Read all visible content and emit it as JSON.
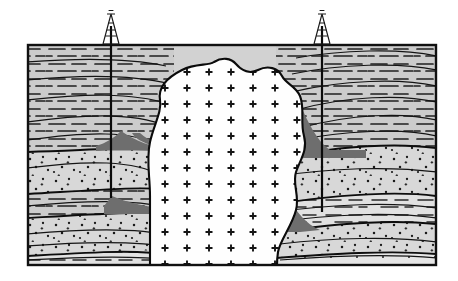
{
  "figure": {
    "domain": "geological-cross-section",
    "title": "",
    "caption": "",
    "background_color": "#ffffff",
    "frame": {
      "x": 27,
      "y": 44,
      "width": 410,
      "height": 222,
      "stroke": "#111111",
      "stroke_width": 2
    }
  },
  "palette": {
    "shale_fill": "#cccccc",
    "sandstone_fill": "#d7d7d7",
    "pale_band_fill": "#e3e3e3",
    "hydrocarbon_trap_fill": "#6e6e6e",
    "intrusion_fill": "#fefefe",
    "line_color": "#111111",
    "pattern_color": "#1a1a1a"
  },
  "legend_symbols": [
    {
      "name": "shale",
      "symbol": "dashed-horizontal-lines",
      "fill": "#cccccc"
    },
    {
      "name": "sandstone",
      "symbol": "stipple-dots",
      "fill": "#d7d7d7"
    },
    {
      "name": "salt-dome-intrusion",
      "symbol": "plus-crosses",
      "fill": "#fefefe"
    },
    {
      "name": "hydrocarbon-trap",
      "symbol": "solid-dark-gray",
      "fill": "#6e6e6e"
    }
  ],
  "intrusion": {
    "label": "salt dome",
    "symbol": "plus-crosses",
    "cross_rows": 14,
    "cross_spacing_x": 22,
    "cross_spacing_y": 16,
    "cross_size": 7
  },
  "strata_left": [
    {
      "name": "upper-shale",
      "rock": "shale",
      "pattern": "dashed"
    },
    {
      "name": "upper-sandstone",
      "rock": "sandstone",
      "pattern": "dots"
    },
    {
      "name": "middle-shale",
      "rock": "shale",
      "pattern": "dashed"
    },
    {
      "name": "lower-sandstone",
      "rock": "sandstone",
      "pattern": "dots"
    },
    {
      "name": "basal-band",
      "rock": "shale",
      "pattern": "dashed"
    }
  ],
  "strata_right": [
    {
      "name": "upper-shale",
      "rock": "shale",
      "pattern": "dashed"
    },
    {
      "name": "upper-sandstone",
      "rock": "sandstone",
      "pattern": "dots"
    },
    {
      "name": "middle-shale",
      "rock": "shale",
      "pattern": "dashed"
    },
    {
      "name": "lower-sandstone",
      "rock": "sandstone",
      "pattern": "dots"
    },
    {
      "name": "basal-band",
      "rock": "shale",
      "pattern": "dashed"
    }
  ],
  "traps": [
    {
      "name": "left-upper-trap",
      "side": "left",
      "fill": "#6e6e6e"
    },
    {
      "name": "left-lower-trap",
      "side": "left",
      "fill": "#6e6e6e"
    },
    {
      "name": "right-upper-trap",
      "side": "right",
      "fill": "#6e6e6e"
    },
    {
      "name": "right-lower-trap",
      "side": "right",
      "fill": "#6e6e6e"
    }
  ],
  "wells": [
    {
      "name": "left-well",
      "derrick_x": 111,
      "surface_y": 44,
      "top_y": 14,
      "bottom_y": 198
    },
    {
      "name": "right-well",
      "derrick_x": 322,
      "surface_y": 44,
      "top_y": 14,
      "bottom_y": 212
    }
  ]
}
